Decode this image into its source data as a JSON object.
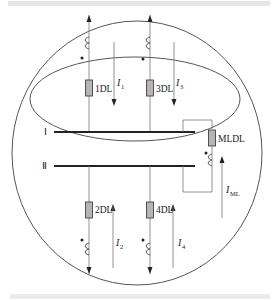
{
  "diagram": {
    "type": "busbar-protection-schematic",
    "buses": [
      {
        "id": "bus-1",
        "label": "Ⅰ"
      },
      {
        "id": "bus-2",
        "label": "Ⅱ"
      }
    ],
    "breakers": [
      {
        "id": "1DL",
        "label": "1DL"
      },
      {
        "id": "3DL",
        "label": "3DL"
      },
      {
        "id": "2DL",
        "label": "2DL"
      },
      {
        "id": "4DL",
        "label": "4DL"
      },
      {
        "id": "MLDL",
        "label": "MLDL"
      }
    ],
    "currents": [
      {
        "id": "I1",
        "symbol": "I",
        "sub": "1",
        "direction": "down"
      },
      {
        "id": "I3",
        "symbol": "I",
        "sub": "3",
        "direction": "down"
      },
      {
        "id": "I2",
        "symbol": "I",
        "sub": "2",
        "direction": "up"
      },
      {
        "id": "I4",
        "symbol": "I",
        "sub": "4",
        "direction": "up"
      },
      {
        "id": "IML",
        "symbol": "I",
        "sub": "ML",
        "direction": "up"
      }
    ],
    "zones": [
      "outer-circle-protection-zone",
      "inner-ellipse-bus-I-zone"
    ]
  }
}
